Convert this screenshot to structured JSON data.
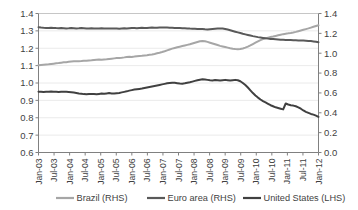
{
  "chart_data": {
    "type": "line",
    "title": "",
    "subtitle": "",
    "xlabel": "",
    "ylabel": "",
    "y2label": "",
    "grid": true,
    "legend_position": "bottom",
    "axes": {
      "left": {
        "label": "",
        "ticks": [
          "0.6",
          "0.7",
          "0.8",
          "0.9",
          "1.0",
          "1.1",
          "1.2",
          "1.3",
          "1.4"
        ],
        "tick_values": [
          0.6,
          0.7,
          0.8,
          0.9,
          1.0,
          1.1,
          1.2,
          1.3,
          1.4
        ],
        "ylim": [
          0.6,
          1.4
        ]
      },
      "right": {
        "label": "",
        "ticks": [
          "0.0",
          "0.2",
          "0.4",
          "0.6",
          "0.8",
          "1.0",
          "1.2",
          "1.4"
        ],
        "tick_values": [
          0.0,
          0.2,
          0.4,
          0.6,
          0.8,
          1.0,
          1.2,
          1.4
        ],
        "ylim": [
          0.0,
          1.4
        ]
      }
    },
    "x_tick_labels": [
      "Jan-03",
      "Jul-03",
      "Jan-04",
      "Jul-04",
      "Jan-05",
      "Jul-05",
      "Jan-06",
      "Jul-06",
      "Jan-07",
      "Jul-07",
      "Jan-08",
      "Jul-08",
      "Jan-09",
      "Jul-09",
      "Jan-10",
      "Jul-10",
      "Jan-11",
      "Jul-11",
      "Jan-12"
    ],
    "x_range": [
      0,
      111
    ],
    "series": [
      {
        "name": "Brazil (RHS)",
        "axis": "right",
        "color": "#a6a6a6",
        "width": 2.0,
        "values": [
          0.88,
          0.882,
          0.884,
          0.886,
          0.888,
          0.892,
          0.895,
          0.898,
          0.901,
          0.905,
          0.908,
          0.91,
          0.913,
          0.916,
          0.918,
          0.919,
          0.92,
          0.921,
          0.923,
          0.924,
          0.926,
          0.928,
          0.931,
          0.934,
          0.936,
          0.935,
          0.937,
          0.939,
          0.942,
          0.945,
          0.948,
          0.951,
          0.953,
          0.955,
          0.958,
          0.962,
          0.965,
          0.963,
          0.966,
          0.97,
          0.972,
          0.974,
          0.977,
          0.98,
          0.984,
          0.988,
          0.993,
          0.999,
          1.005,
          1.012,
          1.02,
          1.029,
          1.038,
          1.046,
          1.053,
          1.06,
          1.066,
          1.072,
          1.078,
          1.084,
          1.09,
          1.098,
          1.106,
          1.113,
          1.12,
          1.124,
          1.12,
          1.114,
          1.106,
          1.098,
          1.09,
          1.082,
          1.074,
          1.068,
          1.062,
          1.056,
          1.05,
          1.045,
          1.042,
          1.041,
          1.043,
          1.048,
          1.056,
          1.066,
          1.078,
          1.092,
          1.106,
          1.12,
          1.132,
          1.142,
          1.15,
          1.157,
          1.163,
          1.168,
          1.174,
          1.18,
          1.186,
          1.192,
          1.197,
          1.2,
          1.204,
          1.209,
          1.215,
          1.222,
          1.229,
          1.236,
          1.243,
          1.25,
          1.258,
          1.266,
          1.274,
          1.282
        ]
      },
      {
        "name": "Euro area (RHS)",
        "axis": "right",
        "color": "#595959",
        "width": 2.0,
        "values": [
          1.262,
          1.258,
          1.256,
          1.255,
          1.254,
          1.256,
          1.255,
          1.253,
          1.252,
          1.253,
          1.252,
          1.25,
          1.251,
          1.253,
          1.252,
          1.25,
          1.251,
          1.253,
          1.252,
          1.25,
          1.249,
          1.251,
          1.25,
          1.248,
          1.249,
          1.251,
          1.25,
          1.249,
          1.248,
          1.25,
          1.249,
          1.248,
          1.247,
          1.249,
          1.251,
          1.25,
          1.252,
          1.254,
          1.253,
          1.252,
          1.254,
          1.256,
          1.255,
          1.254,
          1.256,
          1.258,
          1.257,
          1.256,
          1.258,
          1.26,
          1.259,
          1.258,
          1.257,
          1.256,
          1.255,
          1.254,
          1.253,
          1.252,
          1.251,
          1.25,
          1.248,
          1.247,
          1.246,
          1.245,
          1.244,
          1.243,
          1.241,
          1.24,
          1.242,
          1.244,
          1.246,
          1.248,
          1.25,
          1.248,
          1.244,
          1.238,
          1.231,
          1.224,
          1.217,
          1.21,
          1.203,
          1.196,
          1.19,
          1.184,
          1.178,
          1.172,
          1.167,
          1.162,
          1.158,
          1.154,
          1.15,
          1.147,
          1.144,
          1.142,
          1.14,
          1.138,
          1.136,
          1.135,
          1.134,
          1.133,
          1.132,
          1.131,
          1.13,
          1.129,
          1.128,
          1.127,
          1.126,
          1.124,
          1.122,
          1.119,
          1.115,
          1.11
        ]
      },
      {
        "name": "United States (LHS)",
        "axis": "left",
        "color": "#404040",
        "width": 2.0,
        "values": [
          0.95,
          0.949,
          0.948,
          0.949,
          0.95,
          0.951,
          0.95,
          0.949,
          0.948,
          0.949,
          0.95,
          0.949,
          0.948,
          0.947,
          0.945,
          0.943,
          0.94,
          0.938,
          0.936,
          0.935,
          0.936,
          0.937,
          0.936,
          0.935,
          0.937,
          0.939,
          0.938,
          0.94,
          0.942,
          0.94,
          0.939,
          0.941,
          0.943,
          0.946,
          0.949,
          0.952,
          0.956,
          0.959,
          0.962,
          0.964,
          0.966,
          0.968,
          0.971,
          0.974,
          0.977,
          0.98,
          0.983,
          0.986,
          0.989,
          0.992,
          0.995,
          0.998,
          1.0,
          1.002,
          1.001,
          0.999,
          0.997,
          0.996,
          0.998,
          1.001,
          1.004,
          1.008,
          1.012,
          1.016,
          1.019,
          1.021,
          1.02,
          1.018,
          1.016,
          1.015,
          1.017,
          1.016,
          1.014,
          1.016,
          1.018,
          1.016,
          1.014,
          1.016,
          1.018,
          1.016,
          1.01,
          1.0,
          0.988,
          0.974,
          0.958,
          0.942,
          0.928,
          0.916,
          0.905,
          0.896,
          0.888,
          0.88,
          0.872,
          0.866,
          0.86,
          0.856,
          0.852,
          0.848,
          0.882,
          0.876,
          0.872,
          0.87,
          0.866,
          0.86,
          0.852,
          0.842,
          0.834,
          0.828,
          0.822,
          0.818,
          0.812,
          0.805
        ]
      }
    ],
    "legend_entries": [
      {
        "label": "Brazil (RHS)",
        "color": "#a6a6a6"
      },
      {
        "label": "Euro area (RHS)",
        "color": "#595959"
      },
      {
        "label": "United States (LHS)",
        "color": "#404040"
      }
    ]
  }
}
